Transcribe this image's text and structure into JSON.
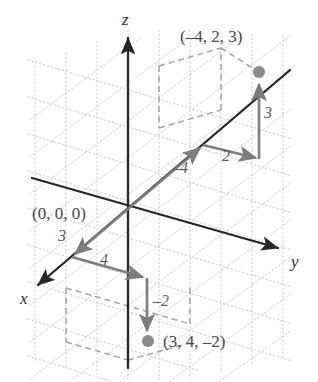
{
  "figure": {
    "type": "3d-coordinate-axes-diagram",
    "background": "#ffffff",
    "grid_color": "#c9c9c9",
    "axis_color": "#262626",
    "vector_color": "#7d7d7d",
    "dash_color": "#a8a8a8",
    "point_color": "#8a8a8a",
    "width": 318,
    "height": 382
  },
  "axes": {
    "x_label": "x",
    "y_label": "y",
    "z_label": "z"
  },
  "origin_label": "(0, 0, 0)",
  "points": [
    {
      "name": "point-upper",
      "label": "(–4, 2, 3)",
      "coords": [
        -4,
        2,
        3
      ],
      "screen": [
        259,
        72
      ]
    },
    {
      "name": "point-lower",
      "label": "(3, 4, –2)",
      "coords": [
        3,
        4,
        -2
      ],
      "screen": [
        148,
        341
      ]
    }
  ],
  "step_labels": [
    {
      "name": "step-neg4",
      "text": "–4",
      "for_point": "(–4, 2, 3)",
      "axis": "x"
    },
    {
      "name": "step-2",
      "text": "2",
      "for_point": "(–4, 2, 3)",
      "axis": "y"
    },
    {
      "name": "step-3up",
      "text": "3",
      "for_point": "(–4, 2, 3)",
      "axis": "z"
    },
    {
      "name": "step-3",
      "text": "3",
      "for_point": "(3, 4, –2)",
      "axis": "x"
    },
    {
      "name": "step-4",
      "text": "4",
      "for_point": "(3, 4, –2)",
      "axis": "y"
    },
    {
      "name": "step-neg2",
      "text": "–2",
      "for_point": "(3, 4, –2)",
      "axis": "z"
    }
  ]
}
